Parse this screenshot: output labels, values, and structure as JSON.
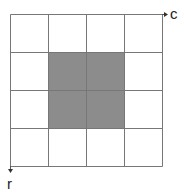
{
  "diagram": {
    "rows": 4,
    "cols": 4,
    "shaded_cells": [
      [
        1,
        1
      ],
      [
        1,
        2
      ],
      [
        2,
        1
      ],
      [
        2,
        2
      ]
    ],
    "shade_color": "#8c8c8c",
    "line_color": "#777777",
    "axis_labels": {
      "x": "c",
      "y": "r"
    }
  }
}
